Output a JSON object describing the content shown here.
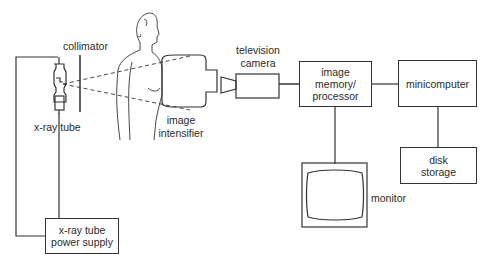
{
  "diagram": {
    "title": "",
    "labels": {
      "collimator": "collimator",
      "xray_tube": "x-ray tube",
      "image_intensifier_1": "image",
      "image_intensifier_2": "intensifier",
      "television_camera_1": "television",
      "television_camera_2": "camera",
      "monitor": "monitor"
    },
    "boxes": {
      "image_memory_1": "image",
      "image_memory_2": "memory/",
      "image_memory_3": "processor",
      "minicomputer": "minicomputer",
      "disk_storage_1": "disk",
      "disk_storage_2": "storage",
      "power_supply_1": "x-ray tube",
      "power_supply_2": "power supply"
    },
    "connections": [
      [
        "x-ray tube",
        "x-ray tube power supply"
      ],
      [
        "television camera",
        "image memory/processor"
      ],
      [
        "image memory/processor",
        "minicomputer"
      ],
      [
        "image memory/processor",
        "monitor"
      ],
      [
        "minicomputer",
        "disk storage"
      ]
    ]
  }
}
